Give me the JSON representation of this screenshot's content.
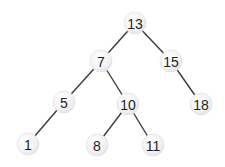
{
  "diagram": {
    "type": "binary-search-tree",
    "colors": {
      "edge": "#3a3a3a",
      "node_fill": "#f1f1f1",
      "node_text": "#1e1e1e",
      "background": "#ffffff"
    },
    "node_radius": 11,
    "nodes": [
      {
        "id": "n13",
        "label": "13",
        "x": 135,
        "y": 23
      },
      {
        "id": "n7",
        "label": "7",
        "x": 101,
        "y": 61
      },
      {
        "id": "n15",
        "label": "15",
        "x": 171,
        "y": 61
      },
      {
        "id": "n5",
        "label": "5",
        "x": 64,
        "y": 102
      },
      {
        "id": "n10",
        "label": "10",
        "x": 128,
        "y": 104
      },
      {
        "id": "n18",
        "label": "18",
        "x": 201,
        "y": 104
      },
      {
        "id": "n1",
        "label": "1",
        "x": 28,
        "y": 144
      },
      {
        "id": "n8",
        "label": "8",
        "x": 97,
        "y": 145
      },
      {
        "id": "n11",
        "label": "11",
        "x": 153,
        "y": 145
      }
    ],
    "edges": [
      {
        "from": "n13",
        "to": "n7"
      },
      {
        "from": "n13",
        "to": "n15"
      },
      {
        "from": "n7",
        "to": "n5"
      },
      {
        "from": "n7",
        "to": "n10"
      },
      {
        "from": "n15",
        "to": "n18"
      },
      {
        "from": "n5",
        "to": "n1"
      },
      {
        "from": "n10",
        "to": "n8"
      },
      {
        "from": "n10",
        "to": "n11"
      }
    ]
  }
}
